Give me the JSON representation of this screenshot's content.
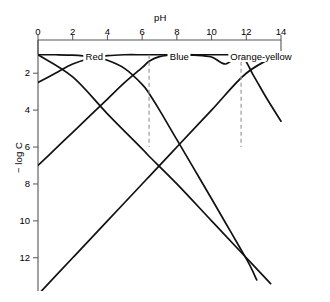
{
  "figure": {
    "cut_off_header": "",
    "x_axis_title": "pH",
    "y_axis_title": "− log C"
  },
  "chart_data": {
    "type": "line",
    "title": "",
    "subtitle": "",
    "xlabel": "pH",
    "ylabel": "− log C",
    "xlim": [
      0,
      14
    ],
    "ylim": [
      13.8,
      0.2
    ],
    "y_axis_inverted": true,
    "grid": false,
    "legend": "none",
    "xticks": [
      0,
      2,
      4,
      6,
      8,
      10,
      12,
      14
    ],
    "xtick_labels": [
      "0",
      "2",
      "4",
      "6",
      "8",
      "10",
      "12",
      "14"
    ],
    "yticks": [
      2,
      4,
      6,
      8,
      10,
      12
    ],
    "ytick_labels": [
      "2",
      "4",
      "6",
      "8",
      "10",
      "12"
    ],
    "annotations": [
      {
        "text": "Red",
        "x": 3.3,
        "y": 1.1
      },
      {
        "text": "Blue",
        "x": 8.2,
        "y": 1.1
      },
      {
        "text": "Orange-yellow",
        "x": 12.9,
        "y": 1.1
      }
    ],
    "vertical_dashed_lines": [
      {
        "x": 6.4,
        "y_from": 1.0,
        "y_to": 6.0,
        "style": "dashed"
      },
      {
        "x": 11.7,
        "y_from": 1.0,
        "y_to": 6.0,
        "style": "dashed"
      }
    ],
    "series": [
      {
        "name": "H2In",
        "points": [
          [
            0.0,
            1.0
          ],
          [
            1.0,
            1.0
          ],
          [
            2.0,
            1.02
          ],
          [
            3.0,
            1.1
          ],
          [
            4.0,
            1.3
          ],
          [
            5.0,
            1.75
          ],
          [
            6.0,
            2.6
          ],
          [
            6.4,
            3.1
          ],
          [
            7.0,
            4.0
          ],
          [
            8.0,
            5.6
          ],
          [
            9.0,
            7.2
          ],
          [
            10.0,
            8.8
          ],
          [
            10.8,
            10.1
          ],
          [
            11.6,
            11.4
          ],
          [
            12.2,
            12.4
          ],
          [
            12.6,
            13.2
          ]
        ]
      },
      {
        "name": "HIn-",
        "points": [
          [
            0.0,
            2.5
          ],
          [
            1.0,
            2.0
          ],
          [
            2.0,
            1.5
          ],
          [
            3.0,
            1.2
          ],
          [
            4.0,
            1.05
          ],
          [
            5.0,
            1.0
          ],
          [
            6.0,
            1.0
          ],
          [
            6.4,
            1.0
          ],
          [
            7.0,
            1.0
          ],
          [
            8.0,
            1.0
          ],
          [
            9.0,
            1.02
          ],
          [
            10.0,
            1.12
          ],
          [
            10.8,
            1.5
          ],
          [
            11.7,
            1.05
          ],
          [
            12.4,
            2.1
          ],
          [
            13.2,
            3.4
          ],
          [
            14.0,
            4.6
          ]
        ]
      },
      {
        "name": "In2-",
        "points": [
          [
            0.0,
            7.0
          ],
          [
            1.0,
            6.1
          ],
          [
            2.0,
            5.2
          ],
          [
            3.0,
            4.3
          ],
          [
            4.0,
            3.4
          ],
          [
            5.0,
            2.5
          ],
          [
            6.0,
            1.7
          ],
          [
            6.4,
            1.35
          ],
          [
            7.0,
            1.1
          ],
          [
            8.0,
            1.0
          ],
          [
            9.0,
            1.0
          ],
          [
            10.0,
            1.0
          ],
          [
            11.0,
            1.0
          ],
          [
            11.7,
            1.0
          ],
          [
            12.5,
            1.0
          ],
          [
            13.2,
            1.0
          ],
          [
            14.0,
            1.0
          ]
        ]
      },
      {
        "name": "OH-",
        "points": [
          [
            0.0,
            14.0
          ],
          [
            2.0,
            12.0
          ],
          [
            4.0,
            10.0
          ],
          [
            6.0,
            8.0
          ],
          [
            6.4,
            7.6
          ],
          [
            8.0,
            6.0
          ],
          [
            10.0,
            4.0
          ],
          [
            12.0,
            2.0
          ],
          [
            14.0,
            0.9
          ]
        ]
      },
      {
        "name": "H+",
        "points": [
          [
            0.0,
            1.0
          ],
          [
            2.0,
            2.2
          ],
          [
            4.0,
            4.2
          ],
          [
            6.0,
            6.1
          ],
          [
            6.4,
            6.5
          ],
          [
            8.0,
            8.0
          ],
          [
            10.0,
            10.0
          ],
          [
            11.7,
            11.7
          ],
          [
            12.6,
            12.6
          ],
          [
            13.4,
            13.4
          ]
        ]
      }
    ]
  }
}
